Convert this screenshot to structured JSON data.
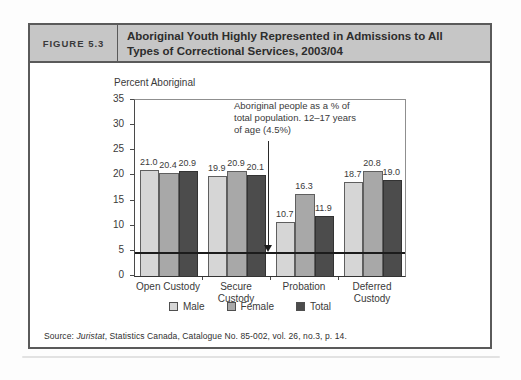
{
  "figure": {
    "label": "FIGURE 5.3",
    "title": "Aboriginal Youth Highly Represented in Admissions to All Types of Correctional Services, 2003/04",
    "source": {
      "prefix": "Source: ",
      "publication": "Juristat",
      "rest": ", Statistics Canada, Catalogue No. 85-002, vol. 26, no.3, p. 14."
    }
  },
  "chart_data": {
    "type": "bar",
    "title": "Aboriginal Youth Highly Represented in Admissions to All Types of Correctional Services, 2003/04",
    "ylabel": "Percent Aboriginal",
    "xlabel": "",
    "ylim": [
      0,
      35
    ],
    "yticks": [
      0,
      5,
      10,
      15,
      20,
      25,
      30,
      35
    ],
    "grid": false,
    "legend_position": "bottom",
    "categories": [
      "Open Custody",
      "Secure Custody",
      "Probation",
      "Deferred Custody"
    ],
    "categories_display": [
      [
        "Open Custody"
      ],
      [
        "Secure",
        "Custody"
      ],
      [
        "Probation"
      ],
      [
        "Deferred",
        "Custody"
      ]
    ],
    "series": [
      {
        "name": "Male",
        "color": "#d6d6d6",
        "values": [
          21.0,
          19.9,
          10.7,
          18.7
        ]
      },
      {
        "name": "Female",
        "color": "#a8a8a8",
        "values": [
          20.4,
          20.9,
          16.3,
          20.8
        ]
      },
      {
        "name": "Total",
        "color": "#4c4c4c",
        "values": [
          20.9,
          20.1,
          11.9,
          19.0
        ]
      }
    ],
    "reference_line": {
      "value": 4.5,
      "color": "#1c1c1c"
    },
    "annotation": {
      "lines": [
        "Aboriginal people as a % of",
        "total population. 12–17 years",
        "of age (4.5%)"
      ]
    }
  }
}
